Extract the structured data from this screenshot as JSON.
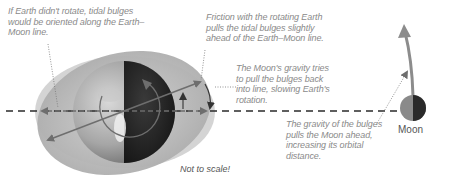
{
  "annotations": {
    "no_rotation": "If Earth didn't rotate, tidal bulges would be oriented along the Earth–Moon line.",
    "friction": "Friction with the rotating Earth pulls the tidal bulges slightly ahead of the Earth–Moon line.",
    "moon_gravity": "The Moon's gravity tries to pull the bulges back into line, slowing Earth's rotation.",
    "bulge_gravity": "The gravity of the bulges pulls the Moon ahead, increasing its orbital distance."
  },
  "labels": {
    "moon": "Moon",
    "scale": "Not to scale!"
  },
  "colors": {
    "bulge_outer": "#c8c8c8",
    "bulge_inner": "#b4b4b4",
    "earth_light": "#9a9a9a",
    "earth_dark": "#1e1e1e",
    "arrow": "#6e6e6e",
    "line": "#333333",
    "note_text": "#8a8a8a"
  }
}
